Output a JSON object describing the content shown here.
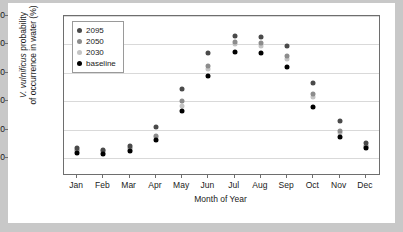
{
  "chart_data": {
    "type": "scatter",
    "title": "",
    "xlabel": "Month of Year",
    "ylabel": "V. vulnificus probability of occurrence in water (%)",
    "ylabel_italic_part": "V. vulnificus",
    "ylabel_rest": " probability",
    "ylabel_line2": "of occurrence in water (%)",
    "categories": [
      "Jan",
      "Feb",
      "Mar",
      "Apr",
      "May",
      "Jun",
      "Jul",
      "Aug",
      "Sep",
      "Oct",
      "Nov",
      "Dec"
    ],
    "ylim": [
      0,
      100
    ],
    "yticks": [
      0,
      20,
      40,
      60,
      80,
      100
    ],
    "grid": true,
    "legend_position": "top-left",
    "series": [
      {
        "name": "2095",
        "color": "#4a4a4a",
        "values": [
          7,
          6,
          9,
          22,
          49,
          74,
          86,
          85,
          79,
          53,
          26,
          11
        ]
      },
      {
        "name": "2050",
        "color": "#8c8c8c",
        "values": [
          6,
          5,
          7,
          16,
          40,
          65,
          82,
          81,
          72,
          45,
          19,
          9
        ]
      },
      {
        "name": "2030",
        "color": "#c4c4c4",
        "values": [
          5,
          4,
          6,
          15,
          37,
          63,
          80,
          79,
          70,
          43,
          18,
          8
        ]
      },
      {
        "name": "baseline",
        "color": "#000000",
        "values": [
          4,
          3,
          5,
          13,
          33,
          58,
          75,
          74,
          64,
          36,
          15,
          7
        ]
      }
    ]
  }
}
